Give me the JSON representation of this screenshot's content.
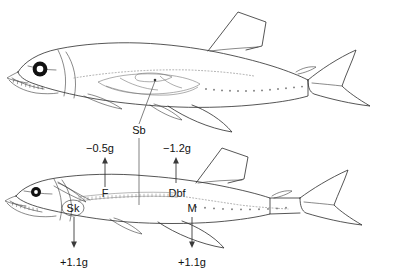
{
  "figure": {
    "panels": [
      {
        "id": "upper",
        "name": "upper-fish-anatomy"
      },
      {
        "id": "lower",
        "name": "lower-fish-forces"
      }
    ]
  },
  "annotations": {
    "swim_bladder": {
      "label": "Sb",
      "name": "swim-bladder-label"
    },
    "fluid": {
      "label": "F",
      "name": "fluid-label"
    },
    "dbf": {
      "label": "Dbf",
      "name": "dbf-label"
    },
    "skeleton": {
      "label": "Sk",
      "name": "skeleton-label"
    },
    "muscle": {
      "label": "M",
      "name": "muscle-label"
    }
  },
  "forces": {
    "fluid_force": {
      "value": "−0.5g",
      "direction": "up",
      "component": "F"
    },
    "dbf_force": {
      "value": "−1.2g",
      "direction": "up",
      "component": "Dbf"
    },
    "skeleton_force": {
      "value": "+1.1g",
      "direction": "down",
      "component": "Sk"
    },
    "muscle_force": {
      "value": "+1.1g",
      "direction": "down",
      "component": "M"
    }
  },
  "colors": {
    "outline": "#2b2b2b",
    "organ": "#6a6a6a",
    "photophore": "#7d7d7d",
    "text": "#111111",
    "background": "#ffffff"
  }
}
